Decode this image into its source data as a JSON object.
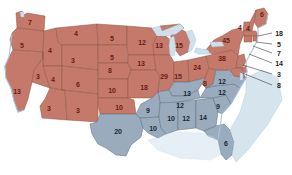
{
  "map": {
    "title": "United States Electoral Vote Map",
    "colors": {
      "republican_fill": "#c4796a",
      "democrat_fill": "#9aabbd",
      "water": "#cfe0ec",
      "border": "#8a5547",
      "background": "#ffffff",
      "red_label": "#6b1f16",
      "blue_label": "#1b2836",
      "callout_label": "#231f20"
    },
    "legend_present": false
  },
  "states": [
    {
      "code": "WA",
      "name": "Washington",
      "votes": "7",
      "party": "red",
      "x": 30,
      "y": 22
    },
    {
      "code": "OR",
      "name": "Oregon",
      "votes": "5",
      "party": "red",
      "x": 22,
      "y": 45
    },
    {
      "code": "CA",
      "name": "California",
      "votes": "13",
      "party": "red",
      "x": 17,
      "y": 91
    },
    {
      "code": "ID",
      "name": "Idaho",
      "votes": "4",
      "party": "red",
      "x": 50,
      "y": 50
    },
    {
      "code": "NV",
      "name": "Nevada",
      "votes": "3",
      "party": "red",
      "x": 38,
      "y": 76
    },
    {
      "code": "MT",
      "name": "Montana",
      "votes": "4",
      "party": "red",
      "x": 76,
      "y": 33
    },
    {
      "code": "WY",
      "name": "Wyoming",
      "votes": "3",
      "party": "red",
      "x": 73,
      "y": 60
    },
    {
      "code": "UT",
      "name": "Utah",
      "votes": "4",
      "party": "red",
      "x": 53,
      "y": 79
    },
    {
      "code": "AZ",
      "name": "Arizona",
      "votes": "3",
      "party": "red",
      "x": 49,
      "y": 108
    },
    {
      "code": "CO",
      "name": "Colorado",
      "votes": "6",
      "party": "red",
      "x": 78,
      "y": 84
    },
    {
      "code": "NM",
      "name": "New Mexico",
      "votes": "3",
      "party": "red",
      "x": 78,
      "y": 110
    },
    {
      "code": "ND",
      "name": "North Dakota",
      "votes": "5",
      "party": "red",
      "x": 112,
      "y": 38
    },
    {
      "code": "SD",
      "name": "South Dakota",
      "votes": "5",
      "party": "red",
      "x": 112,
      "y": 57
    },
    {
      "code": "NE",
      "name": "Nebraska",
      "votes": "8",
      "party": "red",
      "x": 110,
      "y": 70
    },
    {
      "code": "KS",
      "name": "Kansas",
      "votes": "10",
      "party": "red",
      "x": 112,
      "y": 90
    },
    {
      "code": "OK",
      "name": "Oklahoma",
      "votes": "10",
      "party": "red",
      "x": 119,
      "y": 107
    },
    {
      "code": "MN",
      "name": "Minnesota",
      "votes": "12",
      "party": "red",
      "x": 142,
      "y": 42
    },
    {
      "code": "IA",
      "name": "Iowa",
      "votes": "13",
      "party": "red",
      "x": 141,
      "y": 63
    },
    {
      "code": "MO",
      "name": "Missouri",
      "votes": "18",
      "party": "red",
      "x": 144,
      "y": 87
    },
    {
      "code": "AR",
      "name": "Arkansas",
      "votes": "9",
      "party": "blue",
      "x": 148,
      "y": 110
    },
    {
      "code": "LA",
      "name": "Louisiana",
      "votes": "10",
      "party": "blue",
      "x": 153,
      "y": 128
    },
    {
      "code": "WI",
      "name": "Wisconsin",
      "votes": "13",
      "party": "red",
      "x": 159,
      "y": 45
    },
    {
      "code": "IL",
      "name": "Illinois",
      "votes": "29",
      "party": "red",
      "x": 164,
      "y": 76
    },
    {
      "code": "MI",
      "name": "Michigan",
      "votes": "15",
      "party": "red",
      "x": 179,
      "y": 45
    },
    {
      "code": "IN",
      "name": "Indiana",
      "votes": "15",
      "party": "red",
      "x": 178,
      "y": 76
    },
    {
      "code": "KY",
      "name": "Kentucky",
      "votes": "13",
      "party": "blue",
      "x": 187,
      "y": 93
    },
    {
      "code": "TN",
      "name": "Tennessee",
      "votes": "12",
      "party": "blue",
      "x": 180,
      "y": 105
    },
    {
      "code": "MS",
      "name": "Mississippi",
      "votes": "10",
      "party": "blue",
      "x": 171,
      "y": 118
    },
    {
      "code": "AL",
      "name": "Alabama",
      "votes": "12",
      "party": "blue",
      "x": 186,
      "y": 118
    },
    {
      "code": "GA",
      "name": "Georgia",
      "votes": "14",
      "party": "blue",
      "x": 203,
      "y": 117
    },
    {
      "code": "FL",
      "name": "Florida",
      "votes": "6",
      "party": "blue",
      "x": 226,
      "y": 143
    },
    {
      "code": "SC",
      "name": "South Carolina",
      "votes": "9",
      "party": "blue",
      "x": 218,
      "y": 106
    },
    {
      "code": "NC",
      "name": "North Carolina",
      "votes": "12",
      "party": "blue",
      "x": 222,
      "y": 92
    },
    {
      "code": "OH",
      "name": "Ohio",
      "votes": "24",
      "party": "red",
      "x": 197,
      "y": 67
    },
    {
      "code": "WV",
      "name": "West Virginia",
      "votes": "8",
      "party": "red",
      "x": 205,
      "y": 83
    },
    {
      "code": "VA",
      "name": "Virginia",
      "votes": "12",
      "party": "blue",
      "x": 222,
      "y": 81
    },
    {
      "code": "PA",
      "name": "Pennsylvania",
      "votes": "38",
      "party": "red",
      "x": 222,
      "y": 58
    },
    {
      "code": "NY",
      "name": "New York",
      "votes": "45",
      "party": "red",
      "x": 226,
      "y": 40
    },
    {
      "code": "ME",
      "name": "Maine",
      "votes": "6",
      "party": "red",
      "x": 262,
      "y": 14
    },
    {
      "code": "NH",
      "name": "New Hampshire",
      "votes": "4",
      "party": "red",
      "x": 248,
      "y": 28
    },
    {
      "code": "VT",
      "name": "Vermont",
      "votes": "4",
      "party": "red",
      "x": 240,
      "y": 27
    },
    {
      "code": "TX",
      "name": "Texas",
      "votes": "20",
      "party": "blue",
      "x": 118,
      "y": 131
    }
  ],
  "callouts": [
    {
      "code": "MA",
      "name": "Massachusetts",
      "votes": "18",
      "x": 279,
      "y": 33,
      "lx1": 258,
      "ly1": 36,
      "lx2": 272,
      "ly2": 33
    },
    {
      "code": "RI",
      "name": "Rhode Island",
      "votes": "5",
      "x": 279,
      "y": 44,
      "lx1": 256,
      "ly1": 42,
      "lx2": 272,
      "ly2": 44
    },
    {
      "code": "CT",
      "name": "Connecticut",
      "votes": "7",
      "x": 279,
      "y": 53,
      "lx1": 253,
      "ly1": 46,
      "lx2": 272,
      "ly2": 53
    },
    {
      "code": "NJ",
      "name": "New Jersey",
      "votes": "14",
      "x": 279,
      "y": 63,
      "lx1": 249,
      "ly1": 54,
      "lx2": 272,
      "ly2": 63
    },
    {
      "code": "DE",
      "name": "Delaware",
      "votes": "3",
      "x": 279,
      "y": 74,
      "lx1": 243,
      "ly1": 65,
      "lx2": 272,
      "ly2": 74
    },
    {
      "code": "MD",
      "name": "Maryland",
      "votes": "8",
      "x": 279,
      "y": 85,
      "lx1": 240,
      "ly1": 72,
      "lx2": 272,
      "ly2": 85
    }
  ],
  "chart_data": {
    "type": "map",
    "categories": [
      "Republican (red)",
      "Democrat (blue)"
    ],
    "series": [
      {
        "name": "Republican (red)",
        "color": "#c4796a",
        "states": [
          {
            "state": "Washington",
            "votes": 7
          },
          {
            "state": "Oregon",
            "votes": 5
          },
          {
            "state": "California",
            "votes": 13
          },
          {
            "state": "Idaho",
            "votes": 4
          },
          {
            "state": "Nevada",
            "votes": 3
          },
          {
            "state": "Montana",
            "votes": 4
          },
          {
            "state": "Wyoming",
            "votes": 3
          },
          {
            "state": "Utah",
            "votes": 4
          },
          {
            "state": "Arizona",
            "votes": 3
          },
          {
            "state": "Colorado",
            "votes": 6
          },
          {
            "state": "New Mexico",
            "votes": 3
          },
          {
            "state": "North Dakota",
            "votes": 5
          },
          {
            "state": "South Dakota",
            "votes": 5
          },
          {
            "state": "Nebraska",
            "votes": 8
          },
          {
            "state": "Kansas",
            "votes": 10
          },
          {
            "state": "Oklahoma",
            "votes": 10
          },
          {
            "state": "Minnesota",
            "votes": 12
          },
          {
            "state": "Iowa",
            "votes": 13
          },
          {
            "state": "Missouri",
            "votes": 18
          },
          {
            "state": "Wisconsin",
            "votes": 13
          },
          {
            "state": "Illinois",
            "votes": 29
          },
          {
            "state": "Michigan",
            "votes": 15
          },
          {
            "state": "Indiana",
            "votes": 15
          },
          {
            "state": "Ohio",
            "votes": 24
          },
          {
            "state": "West Virginia",
            "votes": 8
          },
          {
            "state": "Pennsylvania",
            "votes": 38
          },
          {
            "state": "New York",
            "votes": 45
          },
          {
            "state": "Maine",
            "votes": 6
          },
          {
            "state": "New Hampshire",
            "votes": 4
          },
          {
            "state": "Vermont",
            "votes": 4
          },
          {
            "state": "Massachusetts",
            "votes": 18
          },
          {
            "state": "Rhode Island",
            "votes": 5
          },
          {
            "state": "Connecticut",
            "votes": 7
          },
          {
            "state": "New Jersey",
            "votes": 14
          }
        ]
      },
      {
        "name": "Democrat (blue)",
        "color": "#9aabbd",
        "states": [
          {
            "state": "Texas",
            "votes": 20
          },
          {
            "state": "Arkansas",
            "votes": 9
          },
          {
            "state": "Louisiana",
            "votes": 10
          },
          {
            "state": "Mississippi",
            "votes": 10
          },
          {
            "state": "Alabama",
            "votes": 12
          },
          {
            "state": "Tennessee",
            "votes": 12
          },
          {
            "state": "Kentucky",
            "votes": 13
          },
          {
            "state": "Georgia",
            "votes": 14
          },
          {
            "state": "Florida",
            "votes": 6
          },
          {
            "state": "South Carolina",
            "votes": 9
          },
          {
            "state": "North Carolina",
            "votes": 12
          },
          {
            "state": "Virginia",
            "votes": 12
          },
          {
            "state": "Delaware",
            "votes": 3
          },
          {
            "state": "Maryland",
            "votes": 8
          }
        ]
      }
    ],
    "legend_position": "none",
    "grid": false
  }
}
